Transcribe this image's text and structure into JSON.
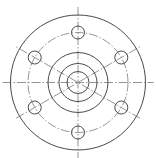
{
  "diagram": {
    "type": "flange-drawing",
    "title": "",
    "colors": {
      "line": "#4a4a4a",
      "centerline": "#7a7a7a",
      "background": "#ffffff"
    },
    "center": [
      78,
      82.5
    ],
    "outer_circle_radius": 67.5,
    "bolt_circle_radius": 50,
    "hub_circles_radii": [
      30,
      19
    ],
    "bore_radius": 11,
    "bolt_holes": {
      "count": 6,
      "radius": 6.5,
      "angles_deg": [
        90,
        30,
        -30,
        -90,
        -150,
        150
      ]
    },
    "labels": []
  }
}
